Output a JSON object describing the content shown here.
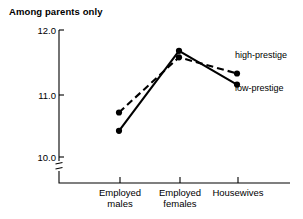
{
  "chart_data": {
    "type": "line",
    "title": "Among parents only",
    "xlabel": "",
    "ylabel": "",
    "categories": [
      "Employed males",
      "Employed females",
      "Housewives"
    ],
    "category_lines": [
      [
        "Employed",
        "males"
      ],
      [
        "Employed",
        "females"
      ],
      [
        "Housewives"
      ]
    ],
    "series": [
      {
        "name": "high-prestige",
        "style": "dashed",
        "marker": "filled-circle",
        "values": [
          10.73,
          11.58,
          11.33
        ]
      },
      {
        "name": "low-prestige",
        "style": "solid",
        "marker": "filled-circle",
        "values": [
          10.45,
          11.68,
          11.16
        ]
      }
    ],
    "ytick_labels": [
      "12.0",
      "11.0",
      "10.0"
    ],
    "ytick_values": [
      12.0,
      11.0,
      10.0
    ],
    "ylim": [
      10.0,
      12.0
    ],
    "axis_break": true,
    "grid": false,
    "legend_position": "inline-right",
    "colors": {
      "line": "#000000",
      "axis": "#000000",
      "background": "#ffffff"
    }
  },
  "labels": {
    "title": "Among parents only",
    "y_12": "12.0",
    "y_11": "11.0",
    "y_10": "10.0",
    "cat_0_line_0": "Employed",
    "cat_0_line_1": "males",
    "cat_1_line_0": "Employed",
    "cat_1_line_1": "females",
    "cat_2_line_0": "Housewives",
    "series_high": "high-prestige",
    "series_low": "low-prestige"
  }
}
